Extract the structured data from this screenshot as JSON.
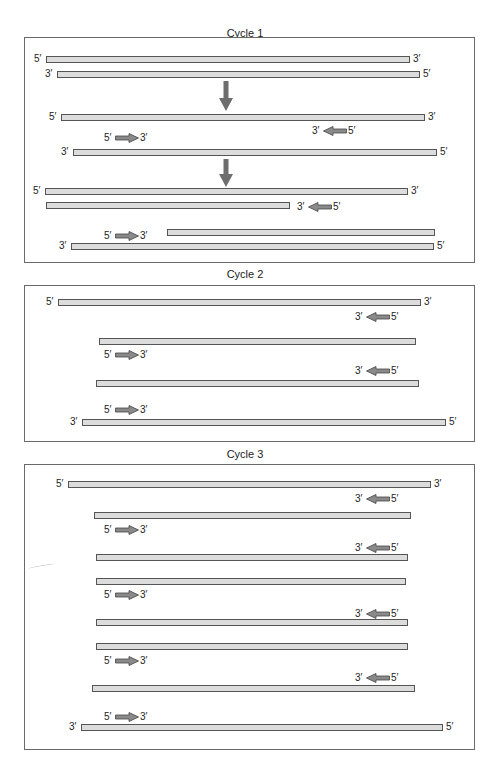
{
  "figure": {
    "colors": {
      "strand_fill": "#dcdcdc",
      "strand_border": "#555555",
      "arrow_fill": "#8a8a8a",
      "panel_border": "#6a6a6a"
    }
  },
  "labels": {
    "five_prime": "5′",
    "three_prime": "3′"
  },
  "panels": [
    {
      "title": "Cycle 1",
      "strands": [
        {
          "x1": 46,
          "x2": 410,
          "y": 56,
          "left": "5′",
          "right": "3′"
        },
        {
          "x1": 57,
          "x2": 420,
          "y": 71,
          "left": "3′",
          "right": "5′"
        },
        {
          "x1": 61,
          "x2": 425,
          "y": 114,
          "left": "5′",
          "right": "3′"
        },
        {
          "x1": 73,
          "x2": 437,
          "y": 149,
          "left": "3′",
          "right": "5′"
        },
        {
          "x1": 45,
          "x2": 408,
          "y": 188,
          "left": "5′",
          "right": "3′"
        },
        {
          "x1": 46,
          "x2": 290,
          "y": 202,
          "left": "",
          "right": ""
        },
        {
          "x1": 167,
          "x2": 435,
          "y": 229,
          "left": "",
          "right": ""
        },
        {
          "x1": 71,
          "x2": 434,
          "y": 243,
          "left": "3′",
          "right": "5′"
        }
      ],
      "primers": [
        {
          "dir": "left",
          "x": 312,
          "y": 126
        },
        {
          "dir": "right",
          "x": 104,
          "y": 133
        },
        {
          "dir": "left",
          "x": 297,
          "y": 202
        },
        {
          "dir": "right",
          "x": 104,
          "y": 231
        }
      ]
    },
    {
      "title": "Cycle 2",
      "strands": [
        {
          "x1": 58,
          "x2": 421,
          "y": 299,
          "left": "5′",
          "right": "3′"
        },
        {
          "x1": 99,
          "x2": 416,
          "y": 338,
          "left": "",
          "right": ""
        },
        {
          "x1": 96,
          "x2": 419,
          "y": 380,
          "left": "",
          "right": ""
        },
        {
          "x1": 82,
          "x2": 446,
          "y": 419,
          "left": "3′",
          "right": "5′"
        }
      ],
      "primers": [
        {
          "dir": "left",
          "x": 355,
          "y": 312
        },
        {
          "dir": "right",
          "x": 104,
          "y": 350
        },
        {
          "dir": "left",
          "x": 355,
          "y": 366
        },
        {
          "dir": "right",
          "x": 104,
          "y": 405
        }
      ]
    },
    {
      "title": "Cycle 3",
      "strands": [
        {
          "x1": 68,
          "x2": 431,
          "y": 481,
          "left": "5′",
          "right": "3′"
        },
        {
          "x1": 94,
          "x2": 411,
          "y": 512,
          "left": "",
          "right": ""
        },
        {
          "x1": 96,
          "x2": 408,
          "y": 554,
          "left": "",
          "right": ""
        },
        {
          "x1": 96,
          "x2": 406,
          "y": 578,
          "left": "",
          "right": ""
        },
        {
          "x1": 96,
          "x2": 408,
          "y": 619,
          "left": "",
          "right": ""
        },
        {
          "x1": 96,
          "x2": 408,
          "y": 643,
          "left": "",
          "right": ""
        },
        {
          "x1": 92,
          "x2": 415,
          "y": 685,
          "left": "",
          "right": ""
        },
        {
          "x1": 81,
          "x2": 443,
          "y": 724,
          "left": "3′",
          "right": "5′"
        }
      ],
      "primers": [
        {
          "dir": "left",
          "x": 355,
          "y": 494
        },
        {
          "dir": "right",
          "x": 104,
          "y": 525
        },
        {
          "dir": "left",
          "x": 355,
          "y": 543
        },
        {
          "dir": "right",
          "x": 104,
          "y": 590
        },
        {
          "dir": "left",
          "x": 355,
          "y": 609
        },
        {
          "dir": "right",
          "x": 104,
          "y": 656
        },
        {
          "dir": "left",
          "x": 355,
          "y": 673
        },
        {
          "dir": "right",
          "x": 104,
          "y": 712
        }
      ]
    }
  ]
}
